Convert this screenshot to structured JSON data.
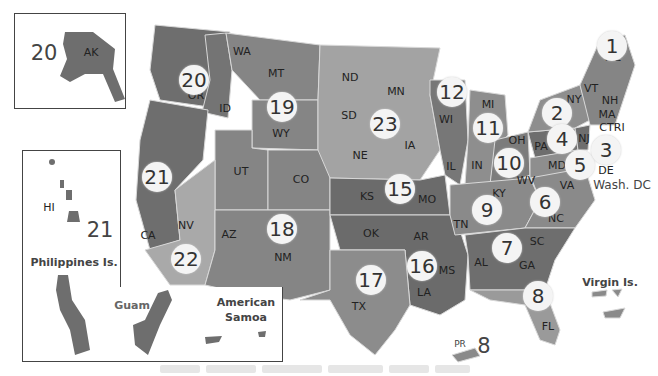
{
  "map": {
    "type": "region-map",
    "subject": "United States numbered regions",
    "colors": {
      "background": "#ffffff",
      "dark": "#6e6e6e",
      "medium": "#858585",
      "light": "#9c9c9c",
      "lighter": "#b0b0b0",
      "badge": "#f4f4f4",
      "border": "#d8d8d8"
    },
    "regions": [
      {
        "number": "1",
        "states": [
          "ME",
          "VT",
          "NH",
          "MA",
          "CT",
          "RI"
        ]
      },
      {
        "number": "2",
        "states": [
          "NY"
        ]
      },
      {
        "number": "3",
        "states": [
          "NJ"
        ]
      },
      {
        "number": "4",
        "states": [
          "PA",
          "DE"
        ]
      },
      {
        "number": "5",
        "states": [
          "MD",
          "WV",
          "Wash. DC"
        ]
      },
      {
        "number": "6",
        "states": [
          "VA",
          "NC"
        ]
      },
      {
        "number": "7",
        "states": [
          "SC",
          "GA",
          "AL"
        ]
      },
      {
        "number": "8",
        "states": [
          "FL",
          "PR",
          "Virgin Is."
        ]
      },
      {
        "number": "9",
        "states": [
          "KY",
          "TN"
        ]
      },
      {
        "number": "10",
        "states": [
          "OH"
        ]
      },
      {
        "number": "11",
        "states": [
          "MI",
          "IN"
        ]
      },
      {
        "number": "12",
        "states": [
          "WI",
          "IL"
        ]
      },
      {
        "number": "15",
        "states": [
          "KS",
          "MO"
        ]
      },
      {
        "number": "16",
        "states": [
          "AR",
          "LA",
          "MS",
          "OK"
        ]
      },
      {
        "number": "17",
        "states": [
          "TX"
        ]
      },
      {
        "number": "18",
        "states": [
          "AZ",
          "NM"
        ]
      },
      {
        "number": "19",
        "states": [
          "MT",
          "WY",
          "UT",
          "CO"
        ]
      },
      {
        "number": "20",
        "states": [
          "WA",
          "OR",
          "ID",
          "AK"
        ]
      },
      {
        "number": "21",
        "states": [
          "CA",
          "NV",
          "HI",
          "Philippines Is.",
          "Guam",
          "American Samoa"
        ]
      },
      {
        "number": "22",
        "states": [
          "CA (south)",
          "NV (south)"
        ]
      },
      {
        "number": "23",
        "states": [
          "ND",
          "SD",
          "MN",
          "NE",
          "IA"
        ]
      }
    ],
    "state_labels": [
      {
        "id": "WA",
        "x": 242,
        "y": 51
      },
      {
        "id": "OR",
        "x": 196,
        "y": 95
      },
      {
        "id": "ID",
        "x": 225,
        "y": 108
      },
      {
        "id": "MT",
        "x": 276,
        "y": 73
      },
      {
        "id": "WY",
        "x": 281,
        "y": 133
      },
      {
        "id": "ND",
        "x": 350,
        "y": 77
      },
      {
        "id": "SD",
        "x": 349,
        "y": 115
      },
      {
        "id": "MN",
        "x": 396,
        "y": 91
      },
      {
        "id": "NE",
        "x": 360,
        "y": 155
      },
      {
        "id": "IA",
        "x": 410,
        "y": 145
      },
      {
        "id": "CA",
        "x": 148,
        "y": 235
      },
      {
        "id": "NV",
        "x": 186,
        "y": 225
      },
      {
        "id": "UT",
        "x": 241,
        "y": 171
      },
      {
        "id": "CO",
        "x": 301,
        "y": 179
      },
      {
        "id": "AZ",
        "x": 229,
        "y": 234
      },
      {
        "id": "NM",
        "x": 283,
        "y": 257
      },
      {
        "id": "KS",
        "x": 367,
        "y": 196
      },
      {
        "id": "MO",
        "x": 427,
        "y": 199
      },
      {
        "id": "OK",
        "x": 371,
        "y": 233
      },
      {
        "id": "AR",
        "x": 421,
        "y": 236
      },
      {
        "id": "TX",
        "x": 359,
        "y": 306
      },
      {
        "id": "LA",
        "x": 424,
        "y": 292
      },
      {
        "id": "MS",
        "x": 447,
        "y": 270
      },
      {
        "id": "AL",
        "x": 481,
        "y": 262
      },
      {
        "id": "GA",
        "x": 527,
        "y": 265
      },
      {
        "id": "SC",
        "x": 537,
        "y": 241
      },
      {
        "id": "TN",
        "x": 461,
        "y": 224
      },
      {
        "id": "KY",
        "x": 499,
        "y": 193
      },
      {
        "id": "IL",
        "x": 451,
        "y": 166
      },
      {
        "id": "IN",
        "x": 477,
        "y": 165
      },
      {
        "id": "WI",
        "x": 446,
        "y": 119
      },
      {
        "id": "MI",
        "x": 488,
        "y": 104
      },
      {
        "id": "OH",
        "x": 517,
        "y": 140
      },
      {
        "id": "WV",
        "x": 526,
        "y": 180
      },
      {
        "id": "VA",
        "x": 567,
        "y": 185
      },
      {
        "id": "NC",
        "x": 556,
        "y": 218
      },
      {
        "id": "PA",
        "x": 541,
        "y": 146
      },
      {
        "id": "MD",
        "x": 557,
        "y": 165
      },
      {
        "id": "NY",
        "x": 574,
        "y": 99
      },
      {
        "id": "VT",
        "x": 591,
        "y": 88
      },
      {
        "id": "NH",
        "x": 610,
        "y": 100
      },
      {
        "id": "MA",
        "x": 607,
        "y": 114
      },
      {
        "id": "CTRI",
        "x": 612,
        "y": 127
      },
      {
        "id": "NJ",
        "x": 584,
        "y": 138
      },
      {
        "id": "DE",
        "x": 606,
        "y": 170
      },
      {
        "id": "ME",
        "x": 613,
        "y": 57
      },
      {
        "id": "FL",
        "x": 548,
        "y": 326
      },
      {
        "id": "AK",
        "x": 91,
        "y": 52
      },
      {
        "id": "HI",
        "x": 49,
        "y": 207
      }
    ],
    "region_badges": [
      {
        "number": "20",
        "x": 194,
        "y": 80
      },
      {
        "number": "19",
        "x": 282,
        "y": 107
      },
      {
        "number": "23",
        "x": 385,
        "y": 124
      },
      {
        "number": "12",
        "x": 452,
        "y": 92
      },
      {
        "number": "11",
        "x": 488,
        "y": 128
      },
      {
        "number": "21",
        "x": 157,
        "y": 177
      },
      {
        "number": "22",
        "x": 186,
        "y": 259
      },
      {
        "number": "18",
        "x": 282,
        "y": 229
      },
      {
        "number": "15",
        "x": 400,
        "y": 189
      },
      {
        "number": "10",
        "x": 509,
        "y": 163
      },
      {
        "number": "9",
        "x": 487,
        "y": 210
      },
      {
        "number": "6",
        "x": 545,
        "y": 202
      },
      {
        "number": "7",
        "x": 507,
        "y": 248
      },
      {
        "number": "16",
        "x": 422,
        "y": 266
      },
      {
        "number": "17",
        "x": 371,
        "y": 280
      },
      {
        "number": "8",
        "x": 538,
        "y": 296
      },
      {
        "number": "2",
        "x": 557,
        "y": 113
      },
      {
        "number": "4",
        "x": 562,
        "y": 139
      },
      {
        "number": "5",
        "x": 580,
        "y": 165
      },
      {
        "number": "3",
        "x": 606,
        "y": 150
      },
      {
        "number": "1",
        "x": 612,
        "y": 46
      }
    ],
    "plain_numbers": [
      {
        "number": "20",
        "x": 44,
        "y": 53,
        "label": "AK region number"
      },
      {
        "number": "21",
        "x": 100,
        "y": 230,
        "label": "HI region number"
      },
      {
        "number": "8",
        "x": 484,
        "y": 346,
        "label": "PR region number"
      }
    ],
    "territory_labels": [
      {
        "text": "Philippines Is.",
        "x": 74,
        "y": 262
      },
      {
        "text": "Guam",
        "x": 132,
        "y": 305
      },
      {
        "text": "American\nSamoa",
        "x": 246,
        "y": 310
      },
      {
        "text": "Virgin Is.",
        "x": 610,
        "y": 282
      },
      {
        "text": "PR",
        "x": 460,
        "y": 344
      },
      {
        "text": "Wash. DC",
        "x": 622,
        "y": 185
      }
    ]
  }
}
